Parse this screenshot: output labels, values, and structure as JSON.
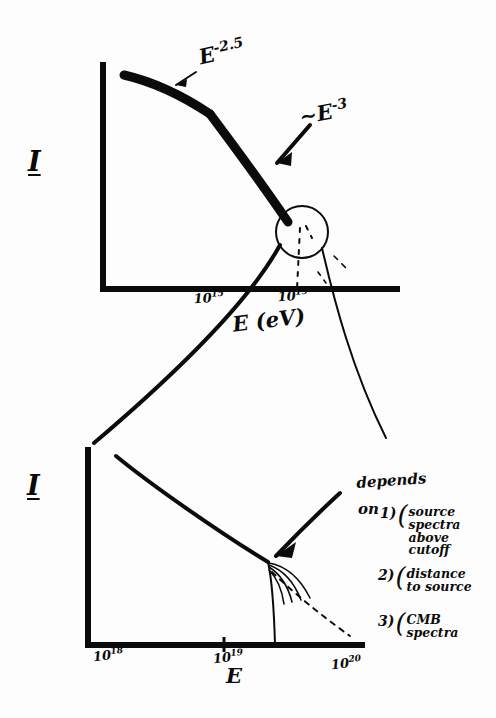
{
  "figure": {
    "kind": "hand-drawn-sketch",
    "ink_color": "#0b0b0b",
    "background_color": "#fdfdfd"
  },
  "top_panel": {
    "y_axis_label": "I",
    "x_axis_label": "E (eV)",
    "x_ticks": [
      {
        "label": "10",
        "exponent": "15"
      },
      {
        "label": "10",
        "exponent": "19"
      }
    ],
    "annotations": [
      {
        "name": "knee-slope",
        "base": "E",
        "exponent": "-2.5",
        "arrow": "down-left"
      },
      {
        "name": "steep-slope",
        "prefix": "~",
        "base": "E",
        "exponent": "-3",
        "arrow": "down-left"
      }
    ],
    "highlight": {
      "shape": "circle",
      "meaning": "zoom-region-at-cutoff"
    }
  },
  "bottom_panel": {
    "y_axis_label": "I",
    "x_axis_label": "E",
    "x_ticks": [
      {
        "label": "10",
        "exponent": "18"
      },
      {
        "label": "10",
        "exponent": "19"
      },
      {
        "label": "10",
        "exponent": "20"
      }
    ],
    "callout": {
      "lead": "depends",
      "lead2": "on",
      "items": [
        {
          "number": "1)",
          "lines": [
            "source",
            "spectra",
            "above",
            "cutoff"
          ]
        },
        {
          "number": "2)",
          "lines": [
            "distance",
            "to source"
          ]
        },
        {
          "number": "3)",
          "lines": [
            "CMB",
            "spectra"
          ]
        }
      ]
    }
  }
}
